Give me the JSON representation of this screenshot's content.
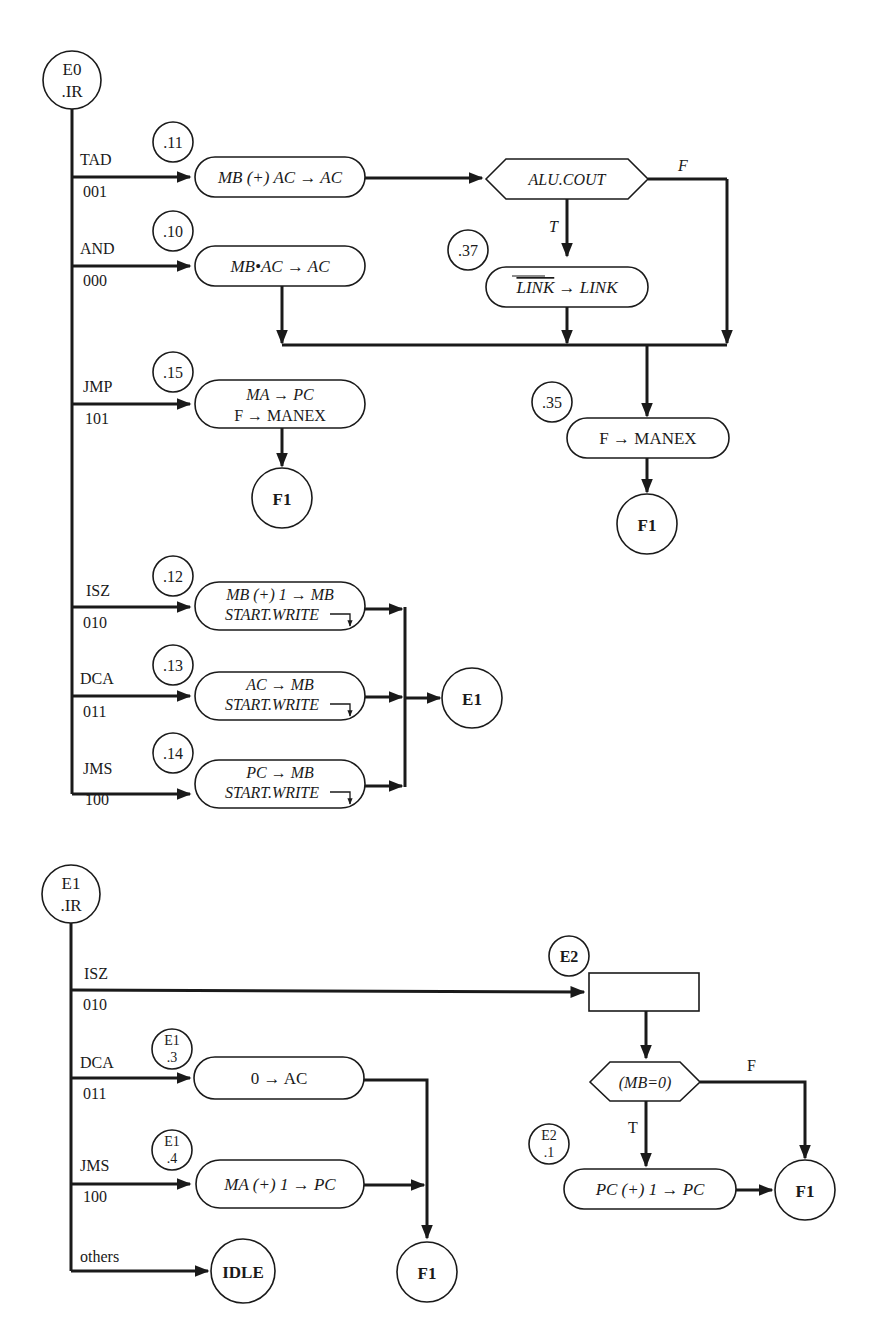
{
  "diagram": {
    "type": "ASM flowchart",
    "colors": {
      "ink": "#1a1a1a",
      "background": "#ffffff"
    },
    "e0": {
      "start_state": {
        "line1": "E0",
        "line2": ".IR"
      },
      "branches": [
        {
          "opcode": "TAD",
          "code": "001",
          "label": ".11",
          "op": "MB (+) AC → AC"
        },
        {
          "opcode": "AND",
          "code": "000",
          "label": ".10",
          "op": "MB•AC → AC"
        },
        {
          "opcode": "JMP",
          "code": "101",
          "label": ".15",
          "op_line1": "MA → PC",
          "op_line2": "F → MANEX"
        },
        {
          "opcode": "ISZ",
          "code": "010",
          "label": ".12",
          "op_line1": "MB (+) 1 → MB",
          "op_line2": "START.WRITE"
        },
        {
          "opcode": "DCA",
          "code": "011",
          "label": ".13",
          "op_line1": "AC → MB",
          "op_line2": "START.WRITE"
        },
        {
          "opcode": "JMS",
          "code": "100",
          "label": ".14",
          "op_line1": "PC → MB",
          "op_line2": "START.WRITE"
        }
      ],
      "decision": {
        "text": "ALU.COUT",
        "true_label": "T",
        "false_label": "F"
      },
      "link_op": {
        "label": ".37",
        "text_over": "LINK",
        "text_rest": " → LINK"
      },
      "manex_op": {
        "label": ".35",
        "text": "F → MANEX"
      },
      "terminals": {
        "f1_a": "F1",
        "f1_b": "F1",
        "e1": "E1"
      }
    },
    "e1": {
      "start_state": {
        "line1": "E1",
        "line2": ".IR"
      },
      "branches": [
        {
          "opcode": "ISZ",
          "code": "010"
        },
        {
          "opcode": "DCA",
          "code": "011",
          "label_line1": "E1",
          "label_line2": ".3",
          "op": "0 → AC"
        },
        {
          "opcode": "JMS",
          "code": "100",
          "label_line1": "E1",
          "label_line2": ".4",
          "op": "MA (+) 1 → PC"
        },
        {
          "opcode": "others"
        }
      ],
      "terminals": {
        "idle": "IDLE",
        "f1": "F1"
      }
    },
    "e2": {
      "state_label": "E2",
      "decision": {
        "text": "(MB=0)",
        "true_label": "T",
        "false_label": "F"
      },
      "op": {
        "label_line1": "E2",
        "label_line2": ".1",
        "text": "PC (+) 1 → PC"
      },
      "terminal": "F1"
    }
  }
}
